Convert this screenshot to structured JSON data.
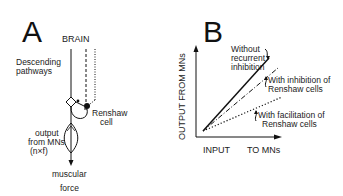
{
  "panel_a": {
    "letter": "A",
    "brain_label": "BRAIN",
    "descending_label_1": "Descending",
    "descending_label_2": "pathways",
    "renshaw_label_1": "Renshaw",
    "renshaw_label_2": "cell",
    "output_label_1": "output",
    "output_label_2": "from MNs",
    "output_label_3": "(n×f)",
    "force_label_1": "muscular",
    "force_label_2": "force"
  },
  "panel_b": {
    "letter": "B",
    "y_axis_label": "OUTPUT   FROM  MNs",
    "x_axis_label_1": "INPUT",
    "x_axis_label_2": "TO MNs",
    "curves": [
      {
        "label_1": "Without",
        "label_2": "recurrent",
        "label_3": "inhibition",
        "style": "solid"
      },
      {
        "label_1": "With inhibition of",
        "label_2": "Renshaw cells",
        "style": "dash-dot"
      },
      {
        "label_1": "With facilitation of",
        "label_2": "Renshaw cells",
        "style": "dotted"
      }
    ]
  },
  "colors": {
    "ink": "#111111",
    "background": "#ffffff"
  }
}
